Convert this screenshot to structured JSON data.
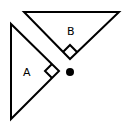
{
  "diagram": {
    "triangles": [
      {
        "label": "A",
        "vertices": [
          [
            11,
            24
          ],
          [
            11,
            119
          ],
          [
            59,
            71
          ]
        ],
        "right_angle_at": [
          59,
          71
        ]
      },
      {
        "label": "B",
        "vertices": [
          [
            24,
            12
          ],
          [
            119,
            12
          ],
          [
            70,
            59
          ]
        ],
        "right_angle_at": [
          70,
          59
        ]
      }
    ],
    "point": {
      "x": 70,
      "y": 72,
      "r": 4
    },
    "stroke_color": "#000000",
    "fill_color": "#ffffff"
  },
  "labels": {
    "a": "A",
    "b": "B"
  }
}
